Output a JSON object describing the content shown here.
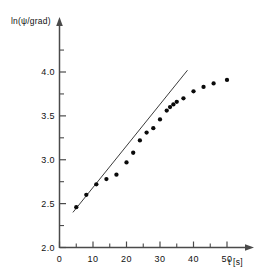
{
  "chart_data": {
    "type": "scatter",
    "title": "",
    "subtitle": "",
    "xlabel": "t [s]",
    "ylabel": "ln(ψ/grad)",
    "xlim": [
      0,
      55
    ],
    "ylim": [
      2.0,
      4.25
    ],
    "grid": false,
    "legend": null,
    "legend_position": "none",
    "x_ticks_major": [
      0,
      10,
      20,
      30,
      40,
      50
    ],
    "x_tick_labels": [
      "0",
      "10",
      "20",
      "30",
      "40",
      "50"
    ],
    "x_ticks_minor": [
      5,
      15,
      25,
      35,
      45
    ],
    "y_ticks_major": [
      2.0,
      2.5,
      3.0,
      3.5,
      4.0
    ],
    "y_tick_labels": [
      "2.0",
      "2.5",
      "3.0",
      "3.5",
      "4.0"
    ],
    "y_ticks_minor": [
      2.25,
      2.75,
      3.25,
      3.75,
      4.25
    ],
    "series": [
      {
        "name": "measurements",
        "type": "scatter",
        "marker": "square-dot",
        "color": "#0a0a0a",
        "x": [
          5,
          8,
          11,
          14,
          17,
          20,
          22,
          24,
          26,
          28,
          30,
          32,
          33,
          34,
          35,
          37,
          40,
          43,
          46,
          50
        ],
        "y": [
          2.46,
          2.6,
          2.72,
          2.78,
          2.83,
          2.97,
          3.08,
          3.22,
          3.31,
          3.36,
          3.46,
          3.56,
          3.6,
          3.63,
          3.66,
          3.7,
          3.78,
          3.83,
          3.87,
          3.91
        ]
      },
      {
        "name": "linear-fit",
        "type": "line",
        "color": "#3c3c3c",
        "x": [
          4.0,
          38.2
        ],
        "y": [
          2.4,
          4.02
        ]
      }
    ]
  },
  "axes": {
    "y_axis_name": "y-axis",
    "x_axis_name": "x-axis",
    "y_label_text": "ln(ψ/grad)",
    "x_label_text": "t [s]"
  }
}
